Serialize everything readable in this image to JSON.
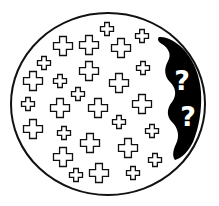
{
  "figure": {
    "colors": {
      "background": "#ffffff",
      "stroke": "#111111",
      "fill_dark": "#000000",
      "question_mark": "#ffffff"
    },
    "circle": {
      "cx": 108,
      "cy": 104,
      "rx": 97,
      "ry": 91
    },
    "question_marks": [
      {
        "label": "?",
        "x": 182,
        "y": 90
      },
      {
        "label": "?",
        "x": 188,
        "y": 126
      }
    ],
    "crosses": [
      {
        "x": 107,
        "y": 29,
        "size": "small"
      },
      {
        "x": 142,
        "y": 36,
        "size": "small"
      },
      {
        "x": 63,
        "y": 46,
        "size": "large"
      },
      {
        "x": 89,
        "y": 45,
        "size": "large"
      },
      {
        "x": 121,
        "y": 48,
        "size": "large"
      },
      {
        "x": 44,
        "y": 63,
        "size": "small"
      },
      {
        "x": 89,
        "y": 71,
        "size": "large"
      },
      {
        "x": 143,
        "y": 68,
        "size": "small"
      },
      {
        "x": 33,
        "y": 81,
        "size": "large"
      },
      {
        "x": 60,
        "y": 81,
        "size": "small"
      },
      {
        "x": 119,
        "y": 83,
        "size": "large"
      },
      {
        "x": 78,
        "y": 94,
        "size": "small"
      },
      {
        "x": 28,
        "y": 104,
        "size": "small"
      },
      {
        "x": 60,
        "y": 108,
        "size": "large"
      },
      {
        "x": 98,
        "y": 108,
        "size": "large"
      },
      {
        "x": 142,
        "y": 104,
        "size": "large"
      },
      {
        "x": 119,
        "y": 122,
        "size": "small"
      },
      {
        "x": 33,
        "y": 129,
        "size": "large"
      },
      {
        "x": 64,
        "y": 133,
        "size": "small"
      },
      {
        "x": 152,
        "y": 131,
        "size": "small"
      },
      {
        "x": 90,
        "y": 143,
        "size": "large"
      },
      {
        "x": 128,
        "y": 148,
        "size": "large"
      },
      {
        "x": 63,
        "y": 157,
        "size": "large"
      },
      {
        "x": 155,
        "y": 160,
        "size": "small"
      },
      {
        "x": 76,
        "y": 175,
        "size": "small"
      },
      {
        "x": 99,
        "y": 173,
        "size": "large"
      },
      {
        "x": 133,
        "y": 173,
        "size": "small"
      }
    ]
  }
}
